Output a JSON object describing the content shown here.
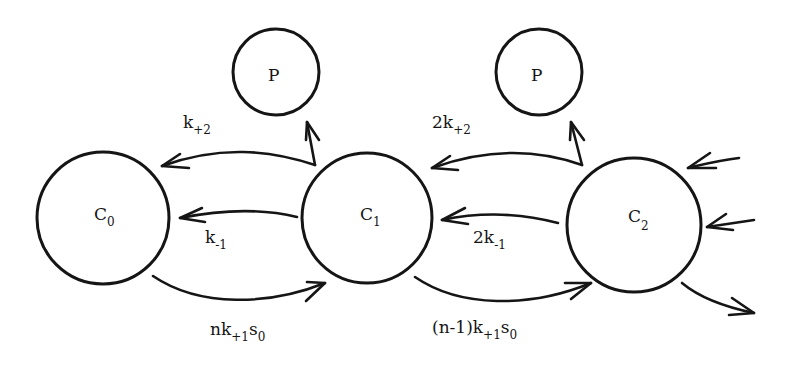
{
  "diagram": {
    "type": "kinetic-state-scheme",
    "nodes": [
      {
        "id": "C0",
        "label": "C",
        "sub": "0"
      },
      {
        "id": "C1",
        "label": "C",
        "sub": "1"
      },
      {
        "id": "C2",
        "label": "C",
        "sub": "2"
      },
      {
        "id": "P1",
        "label": "P"
      },
      {
        "id": "P2",
        "label": "P"
      }
    ],
    "edges": [
      {
        "from": "C1",
        "to": "C0",
        "label": "k",
        "sub": "+2"
      },
      {
        "from": "C1",
        "to": "C0",
        "label": "k",
        "sub": "-1"
      },
      {
        "from": "C0",
        "to": "C1",
        "label": "nk",
        "sub": "+1",
        "tail": "s",
        "tail_sub": "0"
      },
      {
        "from": "C1",
        "to": "P1",
        "label": ""
      },
      {
        "from": "C2",
        "to": "C1",
        "label": "2k",
        "sub": "+2"
      },
      {
        "from": "C2",
        "to": "C1",
        "label": "2k",
        "sub": "-1"
      },
      {
        "from": "C1",
        "to": "C2",
        "label": "(n-1)k",
        "sub": "+1",
        "tail": "s",
        "tail_sub": "0"
      },
      {
        "from": "C2",
        "to": "P2",
        "label": ""
      },
      {
        "from": "offscreen",
        "to": "C2",
        "label": ""
      },
      {
        "from": "offscreen",
        "to": "C2",
        "label": ""
      },
      {
        "from": "C2",
        "to": "offscreen",
        "label": ""
      }
    ]
  }
}
